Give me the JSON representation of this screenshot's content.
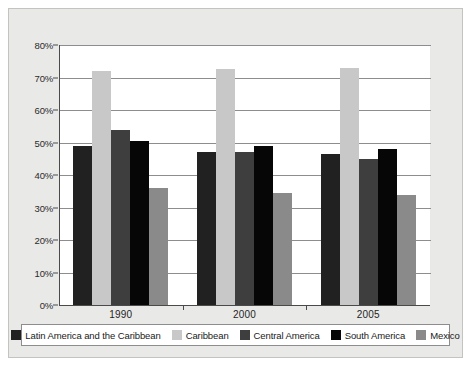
{
  "chart_data": {
    "type": "bar",
    "title": "",
    "subtitle": "",
    "xlabel": "",
    "ylabel": "",
    "categories": [
      "1990",
      "2000",
      "2005"
    ],
    "ylim": [
      0,
      80
    ],
    "ytick_values": [
      0,
      10,
      20,
      30,
      40,
      50,
      60,
      70,
      80
    ],
    "ytick_labels": [
      "0%",
      "10%",
      "20%",
      "30%",
      "40%",
      "50%",
      "60%",
      "70%",
      "80%"
    ],
    "grid": "horizontal",
    "legend_position": "bottom",
    "series": [
      {
        "name": "Latin America and the Caribbean",
        "color": "#212121",
        "values": [
          49,
          47,
          46.5
        ]
      },
      {
        "name": "Caribbean",
        "color": "#c8c8c8",
        "values": [
          72,
          72.5,
          73
        ]
      },
      {
        "name": "Central America",
        "color": "#3e3e3e",
        "values": [
          54,
          47,
          45
        ]
      },
      {
        "name": "South America",
        "color": "#060606",
        "values": [
          50.5,
          49,
          48
        ]
      },
      {
        "name": "Mexico",
        "color": "#8a8a8a",
        "values": [
          36,
          34.5,
          34
        ]
      }
    ]
  },
  "figure": {
    "background_color": "#e9e9e7",
    "plot_background_color": "#ffffff",
    "axis_color": "#4a4a4a",
    "gridline_color": "#8d8d8d"
  }
}
